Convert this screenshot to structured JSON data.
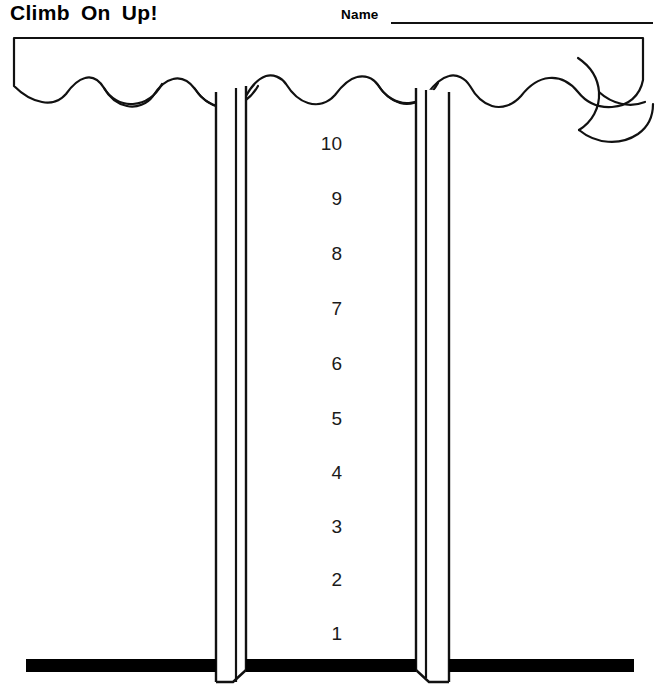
{
  "page": {
    "title": "Climb On Up!",
    "name_label": "Name",
    "name_value": "",
    "background_color": "#ffffff",
    "ink_color": "#000000"
  },
  "worksheet": {
    "kind": "counting-ladder-worksheet",
    "ladder": {
      "rung_numbers": [
        "10",
        "9",
        "8",
        "7",
        "6",
        "5",
        "4",
        "3",
        "2",
        "1"
      ],
      "top_number": "10",
      "bottom_number": "1",
      "count": 10
    },
    "awning": {
      "label": "scalloped-canopy",
      "scallop_count": 12
    },
    "poles": {
      "left_label": "left-pole",
      "right_label": "right-pole",
      "count": 2
    },
    "ground": {
      "label": "ground-bar",
      "color": "#000000"
    }
  }
}
